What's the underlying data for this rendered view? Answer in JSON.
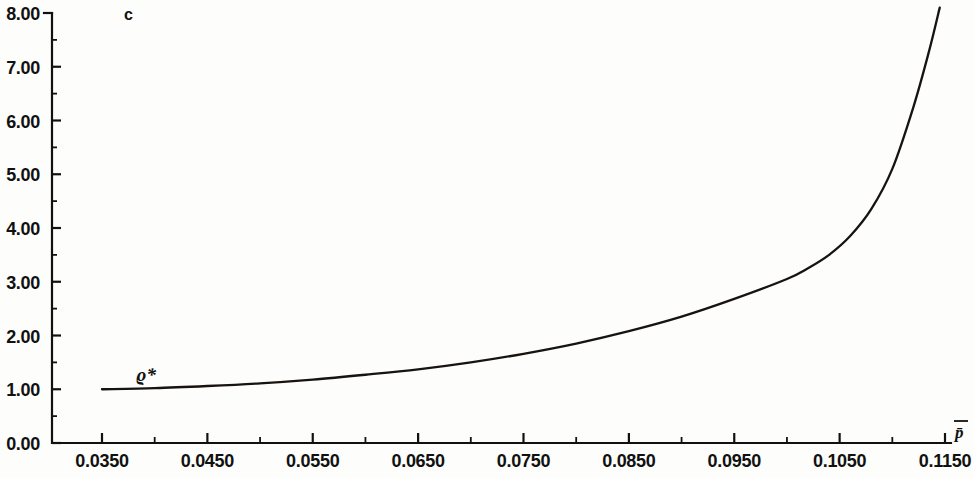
{
  "chart_data": {
    "type": "line",
    "title": "",
    "panel_label": "c",
    "xlabel": "p̄",
    "ylabel": "",
    "xlim": [
      0.03,
      0.11714
    ],
    "ylim": [
      0.0,
      8.0
    ],
    "grid": false,
    "legend": "none",
    "x_tick_labels": [
      "0.0350",
      "0.0450",
      "0.0550",
      "0.0650",
      "0.0750",
      "0.0850",
      "0.0950",
      "0.1050",
      "0.1150"
    ],
    "x_tick_values": [
      0.035,
      0.045,
      0.055,
      0.065,
      0.075,
      0.085,
      0.095,
      0.105,
      0.115
    ],
    "x_minor_tick_values": [
      0.04,
      0.05,
      0.06,
      0.07,
      0.08,
      0.09,
      0.1,
      0.11
    ],
    "y_tick_labels": [
      "0.00",
      "1.00",
      "2.00",
      "3.00",
      "4.00",
      "5.00",
      "6.00",
      "7.00",
      "8.00"
    ],
    "y_tick_values": [
      0.0,
      1.0,
      2.0,
      3.0,
      4.0,
      5.0,
      6.0,
      7.0,
      8.0
    ],
    "y_minor_tick_values": [
      0.5,
      1.5,
      2.5,
      3.5,
      4.5,
      5.5,
      6.5,
      7.5
    ],
    "series": [
      {
        "name": "ϱ*",
        "label_text": "ϱ*",
        "color": "#17130f",
        "x": [
          0.035,
          0.04,
          0.045,
          0.05,
          0.055,
          0.06,
          0.065,
          0.07,
          0.075,
          0.08,
          0.085,
          0.09,
          0.095,
          0.1,
          0.102,
          0.104,
          0.106,
          0.108,
          0.11,
          0.112,
          0.1135,
          0.1145
        ],
        "y": [
          1.0,
          1.02,
          1.06,
          1.11,
          1.18,
          1.27,
          1.37,
          1.5,
          1.66,
          1.85,
          2.08,
          2.35,
          2.68,
          3.05,
          3.25,
          3.5,
          3.85,
          4.35,
          5.1,
          6.25,
          7.3,
          8.1
        ]
      }
    ]
  },
  "figure": {
    "background_color": "#fdfdfb",
    "axis_color": "#111111",
    "curve_color": "#17130f"
  }
}
